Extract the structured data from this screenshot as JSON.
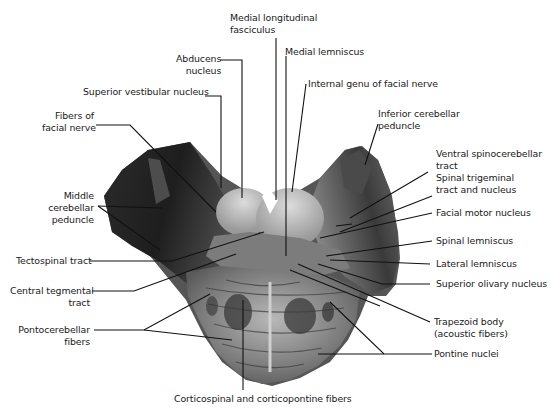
{
  "figure": {
    "colors": {
      "background": "#ffffff",
      "label_text": "#1a1a1a",
      "leader_line": "#111111",
      "tissue_dark": "#2a2a2a",
      "tissue_mid": "#6e6e6e",
      "tissue_light": "#c9c9c9"
    }
  },
  "labels": {
    "medial_longitudinal_fasciculus": {
      "line1": "Medial longitudinal",
      "line2": "fasciculus"
    },
    "abducens_nucleus": {
      "line1": "Abducens",
      "line2": "nucleus"
    },
    "medial_lemniscus": {
      "line1": "Medial lemniscus"
    },
    "internal_genu_facial_nerve": {
      "line1": "Internal genu of facial nerve"
    },
    "superior_vestibular_nucleus": {
      "line1": "Superior vestibular nucleus"
    },
    "inferior_cerebellar_peduncle": {
      "line1": "Inferior cerebellar",
      "line2": "peduncle"
    },
    "fibers_of_facial_nerve": {
      "line1": "Fibers of",
      "line2": "facial nerve"
    },
    "ventral_spinocerebellar_tract": {
      "line1": "Ventral spinocerebellar",
      "line2": "tract"
    },
    "spinal_trigeminal_tract_nucleus": {
      "line1": "Spinal trigeminal",
      "line2": "tract and nucleus"
    },
    "middle_cerebellar_peduncle": {
      "line1": "Middle",
      "line2": "cerebellar",
      "line3": "peduncle"
    },
    "facial_motor_nucleus": {
      "line1": "Facial motor nucleus"
    },
    "tectospinal_tract": {
      "line1": "Tectospinal tract"
    },
    "spinal_lemniscus": {
      "line1": "Spinal lemniscus"
    },
    "lateral_lemniscus": {
      "line1": "Lateral lemniscus"
    },
    "central_tegmental_tract": {
      "line1": "Central tegmental",
      "line2": "tract"
    },
    "superior_olivary_nucleus": {
      "line1": "Superior olivary nucleus"
    },
    "pontocerebellar_fibers": {
      "line1": "Pontocerebellar",
      "line2": "fibers"
    },
    "trapezoid_body": {
      "line1": "Trapezoid body",
      "line2": "(acoustic fibers)"
    },
    "pontine_nuclei": {
      "line1": "Pontine nuclei"
    },
    "corticospinal_corticopontine_fibers": {
      "line1": "Corticospinal and corticopontine fibers"
    }
  }
}
